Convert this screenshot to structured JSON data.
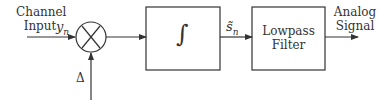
{
  "diagram": {
    "input_label_line1": "Channel",
    "input_label_line2": "Input",
    "input_symbol": "y",
    "input_symbol_sub": "n",
    "multiplier_symbol": "×",
    "step_label": "Δ",
    "integrator_symbol": "∫",
    "integrator_output_symbol": "s̃",
    "integrator_output_sub": "n",
    "filter_label_line1": "Lowpass",
    "filter_label_line2": "Filter",
    "output_label_line1": "Analog",
    "output_label_line2": "Signal"
  },
  "colors": {
    "stroke": "#333333",
    "background": "#ffffff"
  }
}
